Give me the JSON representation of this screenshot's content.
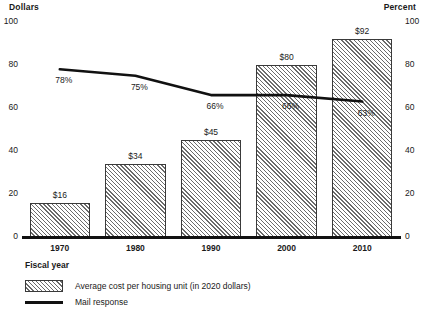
{
  "chart_data": {
    "type": "bar",
    "title": "",
    "subtitle": "",
    "xlabel": "Fiscal year",
    "ylabel": "Dollars",
    "y2label": "Percent",
    "categories": [
      "1970",
      "1980",
      "1990",
      "2000",
      "2010"
    ],
    "ylim": [
      0,
      100
    ],
    "y2lim": [
      0,
      100
    ],
    "yticks": [
      "0",
      "20",
      "40",
      "60",
      "80",
      "100"
    ],
    "y2ticks": [
      "0",
      "20",
      "40",
      "60",
      "80",
      "100"
    ],
    "ytick_values": [
      0,
      20,
      40,
      60,
      80,
      100
    ],
    "grid": false,
    "legend_position": "below",
    "series": [
      {
        "name": "Average cost per housing unit (in 2020 dollars)",
        "type": "bar",
        "axis": "left",
        "values": [
          16,
          34,
          45,
          80,
          92
        ],
        "data_labels": [
          "$16",
          "$34",
          "$45",
          "$80",
          "$92"
        ]
      },
      {
        "name": "Mail response",
        "type": "line",
        "axis": "right",
        "values": [
          78,
          75,
          66,
          66,
          63
        ],
        "data_labels": [
          "78%",
          "75%",
          "66%",
          "66%",
          "63%"
        ]
      }
    ]
  },
  "axis_units": {
    "left": "Dollars",
    "right": "Percent"
  },
  "legend": {
    "items": [
      {
        "label": "Average cost per housing unit (in 2020 dollars)",
        "swatch": "hatched-bar-swatch"
      },
      {
        "label": "Mail response",
        "swatch": "line-swatch"
      }
    ]
  },
  "colors": {
    "line": "#111111",
    "bar_border": "#3a3a3a",
    "bar_hatch": "#6b6b6b",
    "bar_fill": "#ffffff",
    "text": "#1a1a1a",
    "baseline": "#111111"
  }
}
